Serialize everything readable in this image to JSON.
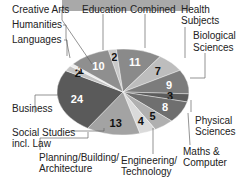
{
  "chart_data": {
    "type": "pie",
    "title": "",
    "start_angle_deg": -103,
    "categories": [
      "Education",
      "Combined",
      "Health Subjects",
      "Biological Sciences",
      "Physical Sciences",
      "Maths & Computer",
      "Engineering/ Technology",
      "Planning/Building/ Architecture",
      "Social Studies incl. Law",
      "Business",
      "Languages",
      "Humanities",
      "Creative Arts"
    ],
    "values": [
      2,
      11,
      7,
      9,
      3,
      8,
      5,
      4,
      13,
      24,
      2,
      1,
      10
    ],
    "colors": [
      "#c9c9c9",
      "#8a8a8a",
      "#bdbdbd",
      "#7c7c7c",
      "#5c5c5c",
      "#6f6f6f",
      "#b0b0b0",
      "#dadada",
      "#a3a3a3",
      "#5a5a5a",
      "#c4c4c4",
      "#ededed",
      "#8f8f8f"
    ],
    "value_label_colors": [
      "#111",
      "#fff",
      "#111",
      "#fff",
      "#111",
      "#fff",
      "#111",
      "#111",
      "#111",
      "#fff",
      "#111",
      "#111",
      "#fff"
    ]
  },
  "labels": {
    "creative_arts": "Creative Arts",
    "humanities": "Humanities",
    "languages": "Languages",
    "education": "Education",
    "combined": "Combined",
    "health_1": "Health",
    "health_2": "Subjects",
    "bio_1": "Biological",
    "bio_2": "Sciences",
    "business": "Business",
    "social_1": "Social Studies",
    "social_2": "incl. Law",
    "phys_1": "Physical",
    "phys_2": "Sciences",
    "maths_1": "Maths &",
    "maths_2": "Computer",
    "planning_1": "Planning/Building/",
    "planning_2": "Architecture",
    "eng_1": "Engineering/",
    "eng_2": "Technology"
  }
}
